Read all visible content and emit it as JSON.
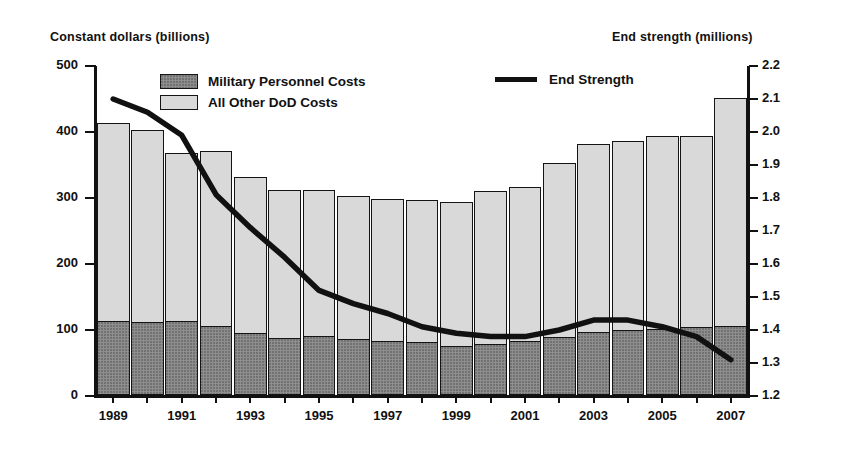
{
  "chart_data": {
    "type": "bar",
    "title": "",
    "subtitle": "",
    "left_axis_label": "Constant dollars (billions)",
    "right_axis_label": "End strength (millions)",
    "xlabel": "",
    "grid": false,
    "legend_position": "top-inside",
    "categories": [
      1989,
      1990,
      1991,
      1992,
      1993,
      1994,
      1995,
      1996,
      1997,
      1998,
      1999,
      2000,
      2001,
      2002,
      2003,
      2004,
      2005,
      2006,
      2007
    ],
    "x_tick_labels": [
      "1989",
      "1991",
      "1993",
      "1995",
      "1997",
      "1999",
      "2001",
      "2003",
      "2005",
      "2007"
    ],
    "ylim": [
      0,
      500
    ],
    "y_ticks": [
      0,
      100,
      200,
      300,
      400,
      500
    ],
    "y2lim": [
      1.2,
      2.2
    ],
    "y2_ticks": [
      "1.2",
      "1.3",
      "1.4",
      "1.5",
      "1.6",
      "1.7",
      "1.8",
      "1.9",
      "2.0",
      "2.1",
      "2.2"
    ],
    "series": [
      {
        "name": "Military Personnel Costs",
        "type": "bar-stack-bottom",
        "color": "#8e8e8e",
        "axis": "left",
        "values": [
          112,
          110,
          112,
          104,
          94,
          86,
          90,
          85,
          82,
          80,
          75,
          78,
          82,
          88,
          95,
          98,
          100,
          103,
          104
        ]
      },
      {
        "name": "All Other DoD Costs",
        "type": "bar-stack-top",
        "color": "#d9d9d9",
        "axis": "left",
        "values": [
          300,
          292,
          255,
          265,
          236,
          224,
          221,
          217,
          215,
          216,
          218,
          231,
          233,
          264,
          286,
          287,
          293,
          290,
          346
        ]
      },
      {
        "name": "Total DoD Costs",
        "type": "bar-total",
        "axis": "left",
        "values": [
          412,
          402,
          367,
          369,
          330,
          310,
          311,
          302,
          297,
          296,
          293,
          309,
          315,
          352,
          381,
          385,
          393,
          393,
          450
        ]
      },
      {
        "name": "End Strength",
        "type": "line",
        "color": "#111111",
        "axis": "right",
        "values": [
          2.1,
          2.06,
          1.99,
          1.81,
          1.71,
          1.62,
          1.52,
          1.48,
          1.45,
          1.41,
          1.39,
          1.38,
          1.38,
          1.4,
          1.43,
          1.43,
          1.41,
          1.38,
          1.31
        ]
      }
    ],
    "legend": [
      {
        "label": "Military Personnel Costs",
        "marker": "swatch-dark"
      },
      {
        "label": "All Other DoD Costs",
        "marker": "swatch-light"
      },
      {
        "label": "End Strength",
        "marker": "line-black"
      }
    ]
  }
}
